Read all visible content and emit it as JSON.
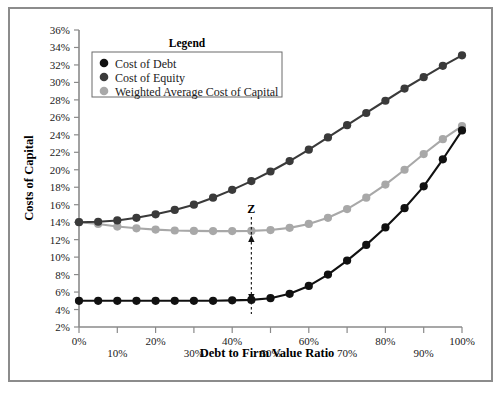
{
  "chart_data": {
    "type": "line",
    "title": "",
    "xlabel": "Debt to Firm Value Ratio",
    "ylabel": "Costs of Capital",
    "xlim": [
      0,
      100
    ],
    "ylim": [
      2,
      36
    ],
    "grid": false,
    "legend_position": "top-center",
    "legend_title": "Legend",
    "x": [
      0,
      5,
      10,
      15,
      20,
      25,
      30,
      35,
      40,
      45,
      50,
      55,
      60,
      65,
      70,
      75,
      80,
      85,
      90,
      95,
      100
    ],
    "xticks": [
      "0%",
      "10%",
      "20%",
      "30%",
      "40%",
      "50%",
      "60%",
      "70%",
      "80%",
      "90%",
      "100%"
    ],
    "xtick_values": [
      0,
      10,
      20,
      30,
      40,
      50,
      60,
      70,
      80,
      90,
      100
    ],
    "yticks": [
      "2%",
      "4%",
      "6%",
      "8%",
      "10%",
      "12%",
      "14%",
      "16%",
      "18%",
      "20%",
      "22%",
      "24%",
      "26%",
      "28%",
      "30%",
      "32%",
      "34%",
      "36%"
    ],
    "ytick_values": [
      2,
      4,
      6,
      8,
      10,
      12,
      14,
      16,
      18,
      20,
      22,
      24,
      26,
      28,
      30,
      32,
      34,
      36
    ],
    "series": [
      {
        "name": "Cost of Debt",
        "color": "#111111",
        "values": [
          5.0,
          5.0,
          5.0,
          5.0,
          5.0,
          5.0,
          5.0,
          5.0,
          5.05,
          5.1,
          5.3,
          5.8,
          6.7,
          8.0,
          9.6,
          11.4,
          13.4,
          15.6,
          18.1,
          21.2,
          24.5
        ]
      },
      {
        "name": "Cost of Equity",
        "color": "#3a3a3a",
        "values": [
          14.0,
          14.05,
          14.2,
          14.5,
          14.9,
          15.4,
          16.0,
          16.8,
          17.7,
          18.7,
          19.8,
          21.0,
          22.3,
          23.7,
          25.1,
          26.5,
          27.9,
          29.3,
          30.6,
          31.9,
          33.1
        ]
      },
      {
        "name": "Weighted Average Cost of Capital",
        "color": "#a8a8a8",
        "values": [
          14.0,
          13.8,
          13.5,
          13.3,
          13.15,
          13.05,
          13.0,
          12.98,
          12.98,
          13.0,
          13.1,
          13.35,
          13.8,
          14.5,
          15.5,
          16.8,
          18.3,
          20.0,
          21.8,
          23.5,
          25.0
        ]
      }
    ],
    "annotations": [
      {
        "label": "Z",
        "x": 45,
        "y_top": 13.0,
        "y_bottom": 5.1,
        "style": "double-headed-dashed-vertical-arrow"
      }
    ]
  },
  "legend": {
    "title": "Legend",
    "entries": [
      {
        "label": "Cost of Debt",
        "color": "#111111"
      },
      {
        "label": "Cost of Equity",
        "color": "#3a3a3a"
      },
      {
        "label": "Weighted Average Cost of Capital",
        "color": "#a8a8a8"
      }
    ]
  },
  "colors": {
    "frame_border": "#8c8c8c",
    "axis": "#8a8a8a",
    "background": "#ffffff",
    "text": "#1a1a1a"
  }
}
